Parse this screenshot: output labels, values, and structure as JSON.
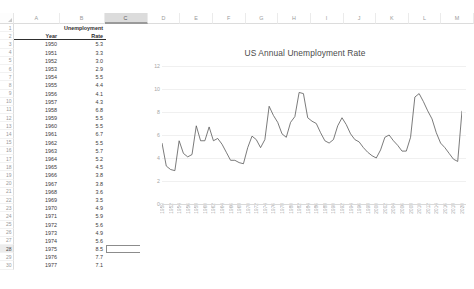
{
  "app": {
    "type": "spreadsheet",
    "selected_column": "C",
    "active_cell": "C28"
  },
  "columns": [
    "A",
    "B",
    "C",
    "D",
    "E",
    "F",
    "G",
    "H",
    "I",
    "J",
    "K",
    "L",
    "M"
  ],
  "rows": [
    1,
    2,
    3,
    4,
    5,
    6,
    7,
    8,
    9,
    10,
    11,
    12,
    13,
    14,
    15,
    16,
    17,
    18,
    19,
    20,
    21,
    22,
    23,
    24,
    25,
    26,
    27,
    28,
    29,
    30
  ],
  "sheet": {
    "header_top": {
      "b": "Unemployment"
    },
    "header": {
      "a": "Year",
      "b": "Rate"
    },
    "data": [
      {
        "year": "1950",
        "rate": "5.3"
      },
      {
        "year": "1951",
        "rate": "3.3"
      },
      {
        "year": "1952",
        "rate": "3.0"
      },
      {
        "year": "1953",
        "rate": "2.9"
      },
      {
        "year": "1954",
        "rate": "5.5"
      },
      {
        "year": "1955",
        "rate": "4.4"
      },
      {
        "year": "1956",
        "rate": "4.1"
      },
      {
        "year": "1957",
        "rate": "4.3"
      },
      {
        "year": "1958",
        "rate": "6.8"
      },
      {
        "year": "1959",
        "rate": "5.5"
      },
      {
        "year": "1960",
        "rate": "5.5"
      },
      {
        "year": "1961",
        "rate": "6.7"
      },
      {
        "year": "1962",
        "rate": "5.5"
      },
      {
        "year": "1963",
        "rate": "5.7"
      },
      {
        "year": "1964",
        "rate": "5.2"
      },
      {
        "year": "1965",
        "rate": "4.5"
      },
      {
        "year": "1966",
        "rate": "3.8"
      },
      {
        "year": "1967",
        "rate": "3.8"
      },
      {
        "year": "1968",
        "rate": "3.6"
      },
      {
        "year": "1969",
        "rate": "3.5"
      },
      {
        "year": "1970",
        "rate": "4.9"
      },
      {
        "year": "1971",
        "rate": "5.9"
      },
      {
        "year": "1972",
        "rate": "5.6"
      },
      {
        "year": "1973",
        "rate": "4.9"
      },
      {
        "year": "1974",
        "rate": "5.6"
      },
      {
        "year": "1975",
        "rate": "8.5"
      },
      {
        "year": "1976",
        "rate": "7.7"
      },
      {
        "year": "1977",
        "rate": "7.1"
      },
      {
        "year": "1978",
        "rate": "6.1"
      }
    ]
  },
  "chart_data": {
    "type": "line",
    "title": "US Annual Unemployment Rate",
    "xlabel": "",
    "ylabel": "",
    "ylim": [
      0,
      12
    ],
    "yticks": [
      0,
      2,
      4,
      6,
      8,
      10,
      12
    ],
    "grid": true,
    "legend": false,
    "line_color": "#595959",
    "xtick_labels": [
      "1950",
      "1952",
      "1954",
      "1956",
      "1958",
      "1960",
      "1962",
      "1964",
      "1966",
      "1968",
      "1970",
      "1972",
      "1974",
      "1976",
      "1978",
      "1980",
      "1982",
      "1984",
      "1986",
      "1988",
      "1990",
      "1992",
      "1994",
      "1996",
      "1998",
      "2000",
      "2002",
      "2004",
      "2006",
      "2008",
      "2010",
      "2012",
      "2014",
      "2016",
      "2018",
      "2020"
    ],
    "x": [
      1950,
      1951,
      1952,
      1953,
      1954,
      1955,
      1956,
      1957,
      1958,
      1959,
      1960,
      1961,
      1962,
      1963,
      1964,
      1965,
      1966,
      1967,
      1968,
      1969,
      1970,
      1971,
      1972,
      1973,
      1974,
      1975,
      1976,
      1977,
      1978,
      1979,
      1980,
      1981,
      1982,
      1983,
      1984,
      1985,
      1986,
      1987,
      1988,
      1989,
      1990,
      1991,
      1992,
      1993,
      1994,
      1995,
      1996,
      1997,
      1998,
      1999,
      2000,
      2001,
      2002,
      2003,
      2004,
      2005,
      2006,
      2007,
      2008,
      2009,
      2010,
      2011,
      2012,
      2013,
      2014,
      2015,
      2016,
      2017,
      2018,
      2019,
      2020
    ],
    "values": [
      5.3,
      3.3,
      3.0,
      2.9,
      5.5,
      4.4,
      4.1,
      4.3,
      6.8,
      5.5,
      5.5,
      6.7,
      5.5,
      5.7,
      5.2,
      4.5,
      3.8,
      3.8,
      3.6,
      3.5,
      4.9,
      5.9,
      5.6,
      4.9,
      5.6,
      8.5,
      7.7,
      7.1,
      6.1,
      5.8,
      7.1,
      7.6,
      9.7,
      9.6,
      7.5,
      7.2,
      7.0,
      6.2,
      5.5,
      5.3,
      5.6,
      6.8,
      7.5,
      6.9,
      6.1,
      5.6,
      5.4,
      4.9,
      4.5,
      4.2,
      4.0,
      4.7,
      5.8,
      6.0,
      5.5,
      5.1,
      4.6,
      4.6,
      5.8,
      9.3,
      9.6,
      8.9,
      8.1,
      7.4,
      6.2,
      5.3,
      4.9,
      4.4,
      3.9,
      3.7,
      8.1
    ]
  }
}
